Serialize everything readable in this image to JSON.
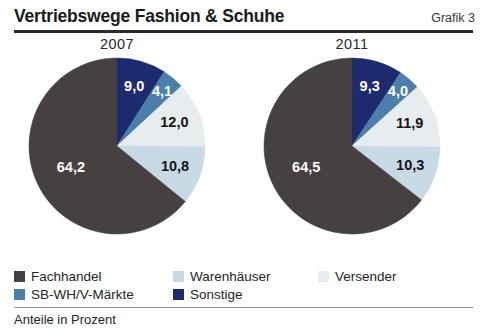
{
  "header": {
    "title": "Vertriebswege Fashion & Schuhe",
    "grafik_label": "Grafik 3"
  },
  "footer": {
    "note": "Anteile in Prozent"
  },
  "colors": {
    "fachhandel": "#474040",
    "warenhaeuser": "#c9dae7",
    "versender": "#e7ecef",
    "sb_wh_v_maerkte": "#4a7fab",
    "sonstige": "#1c2a6e",
    "rule_dark": "#2b2b2b",
    "rule_light": "#8e8e8e",
    "text": "#252525"
  },
  "legend": {
    "items": [
      {
        "label": "Fachhandel",
        "color": "#474040",
        "swatch_name": "legend-swatch-fachhandel"
      },
      {
        "label": "SB-WH/V-Märkte",
        "color": "#4a7fab",
        "swatch_name": "legend-swatch-sb-wh-v-maerkte"
      },
      {
        "label": "Warenhäuser",
        "color": "#c9dae7",
        "swatch_name": "legend-swatch-warenhaeuser"
      },
      {
        "label": "Sonstige",
        "color": "#1c2a6e",
        "swatch_name": "legend-swatch-sonstige"
      },
      {
        "label": "Versender",
        "color": "#e7ecef",
        "swatch_name": "legend-swatch-versender"
      }
    ]
  },
  "chart_data": {
    "type": "pie",
    "title": "Vertriebswege Fashion & Schuhe",
    "subtitle": "",
    "xlabel": "",
    "ylabel": "",
    "unit": "Prozent",
    "note": "Anteile in Prozent",
    "value_format": "comma-decimal",
    "start_angle_deg": 0,
    "direction": "clockwise",
    "legend_position": "bottom",
    "grid": false,
    "categories": [
      "Sonstige",
      "SB-WH/V-Märkte",
      "Versender",
      "Warenhäuser",
      "Fachhandel"
    ],
    "category_colors": [
      "#1c2a6e",
      "#4a7fab",
      "#e7ecef",
      "#c9dae7",
      "#474040"
    ],
    "charts": [
      {
        "name": "pie-2007",
        "year": "2007",
        "slices": [
          {
            "category": "Sonstige",
            "value": 9.0,
            "label": "9,0",
            "color": "#1c2a6e",
            "label_color": "light"
          },
          {
            "category": "SB-WH/V-Märkte",
            "value": 4.1,
            "label": "4,1",
            "color": "#4a7fab",
            "label_color": "light"
          },
          {
            "category": "Versender",
            "value": 12.0,
            "label": "12,0",
            "color": "#e7ecef",
            "label_color": "dark"
          },
          {
            "category": "Warenhäuser",
            "value": 10.8,
            "label": "10,8",
            "color": "#c9dae7",
            "label_color": "dark"
          },
          {
            "category": "Fachhandel",
            "value": 64.2,
            "label": "64,2",
            "color": "#474040",
            "label_color": "light"
          }
        ]
      },
      {
        "name": "pie-2011",
        "year": "2011",
        "slices": [
          {
            "category": "Sonstige",
            "value": 9.3,
            "label": "9,3",
            "color": "#1c2a6e",
            "label_color": "light"
          },
          {
            "category": "SB-WH/V-Märkte",
            "value": 4.0,
            "label": "4,0",
            "color": "#4a7fab",
            "label_color": "light"
          },
          {
            "category": "Versender",
            "value": 11.9,
            "label": "11,9",
            "color": "#e7ecef",
            "label_color": "dark"
          },
          {
            "category": "Warenhäuser",
            "value": 10.3,
            "label": "10,3",
            "color": "#c9dae7",
            "label_color": "dark"
          },
          {
            "category": "Fachhandel",
            "value": 64.5,
            "label": "64,5",
            "color": "#474040",
            "label_color": "light"
          }
        ]
      }
    ]
  }
}
